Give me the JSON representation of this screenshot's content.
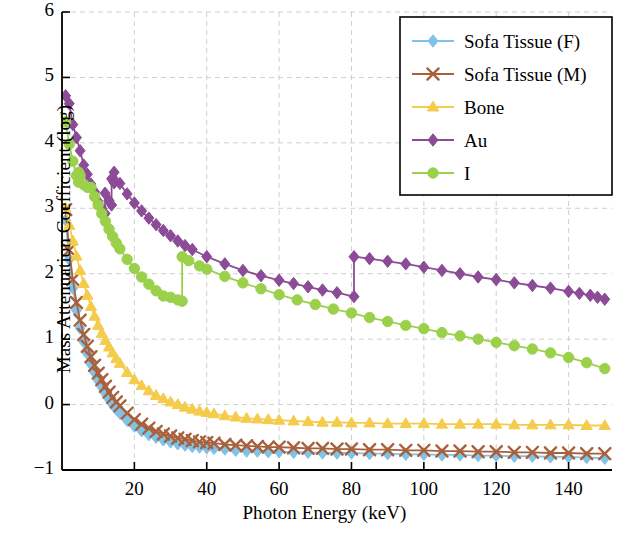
{
  "chart_data": {
    "type": "line",
    "title": "",
    "xlabel": "Photon Energy (keV)",
    "ylabel": "Mass Attenuation Coefficient (log)",
    "xlim": [
      0,
      152
    ],
    "ylim": [
      -1,
      6
    ],
    "xticks": [
      20,
      40,
      60,
      80,
      100,
      120,
      140
    ],
    "yticks": [
      -1,
      0,
      1,
      2,
      3,
      4,
      5,
      6
    ],
    "ytick_labels": [
      "−1",
      "0",
      "1",
      "2",
      "3",
      "4",
      "5",
      "6"
    ],
    "grid": true,
    "legend_position": "top-right",
    "series": [
      {
        "name": "Sofa Tissue (F)",
        "color": "#7FC3E8",
        "marker": "diamond",
        "x": [
          1,
          2,
          3,
          4,
          5,
          6,
          7,
          8,
          9,
          10,
          11,
          12,
          13,
          14,
          15,
          16,
          18,
          20,
          22,
          24,
          26,
          28,
          30,
          32,
          34,
          36,
          38,
          40,
          42,
          45,
          48,
          51,
          54,
          57,
          60,
          64,
          68,
          72,
          76,
          80,
          85,
          90,
          95,
          100,
          105,
          110,
          115,
          120,
          125,
          130,
          135,
          140,
          145,
          150
        ],
        "y": [
          2.82,
          2.22,
          1.78,
          1.44,
          1.17,
          0.96,
          0.78,
          0.62,
          0.49,
          0.37,
          0.27,
          0.17,
          0.08,
          0.0,
          -0.07,
          -0.13,
          -0.24,
          -0.33,
          -0.4,
          -0.46,
          -0.5,
          -0.54,
          -0.57,
          -0.6,
          -0.62,
          -0.64,
          -0.65,
          -0.66,
          -0.67,
          -0.68,
          -0.7,
          -0.71,
          -0.71,
          -0.72,
          -0.72,
          -0.73,
          -0.73,
          -0.74,
          -0.74,
          -0.74,
          -0.75,
          -0.75,
          -0.76,
          -0.76,
          -0.77,
          -0.77,
          -0.78,
          -0.78,
          -0.79,
          -0.79,
          -0.8,
          -0.8,
          -0.81,
          -0.82
        ]
      },
      {
        "name": "Sofa Tissue (M)",
        "color": "#A9603C",
        "marker": "x",
        "x": [
          1,
          2,
          3,
          4,
          5,
          6,
          7,
          8,
          9,
          10,
          11,
          12,
          13,
          14,
          15,
          16,
          18,
          20,
          22,
          24,
          26,
          28,
          30,
          32,
          34,
          36,
          38,
          40,
          42,
          45,
          48,
          51,
          54,
          57,
          60,
          64,
          68,
          72,
          76,
          80,
          85,
          90,
          95,
          100,
          105,
          110,
          115,
          120,
          125,
          130,
          135,
          140,
          145,
          150
        ],
        "y": [
          2.98,
          2.36,
          1.91,
          1.56,
          1.29,
          1.07,
          0.89,
          0.73,
          0.6,
          0.48,
          0.38,
          0.28,
          0.19,
          0.11,
          0.04,
          -0.02,
          -0.13,
          -0.23,
          -0.3,
          -0.36,
          -0.41,
          -0.45,
          -0.48,
          -0.51,
          -0.53,
          -0.55,
          -0.57,
          -0.58,
          -0.59,
          -0.61,
          -0.62,
          -0.63,
          -0.64,
          -0.65,
          -0.65,
          -0.66,
          -0.67,
          -0.67,
          -0.68,
          -0.68,
          -0.69,
          -0.69,
          -0.7,
          -0.7,
          -0.71,
          -0.71,
          -0.72,
          -0.72,
          -0.73,
          -0.73,
          -0.74,
          -0.74,
          -0.75,
          -0.75
        ]
      },
      {
        "name": "Bone",
        "color": "#F5CB4C",
        "marker": "triangle",
        "x": [
          1,
          2,
          3,
          4,
          5,
          6,
          7,
          8,
          9,
          10,
          11,
          12,
          13,
          14,
          15,
          16,
          18,
          20,
          22,
          24,
          26,
          28,
          30,
          32,
          34,
          36,
          38,
          40,
          42,
          45,
          48,
          51,
          54,
          57,
          60,
          64,
          68,
          72,
          76,
          80,
          85,
          90,
          95,
          100,
          105,
          110,
          115,
          120,
          125,
          130,
          135,
          140,
          145,
          150
        ],
        "y": [
          3.0,
          2.74,
          2.5,
          2.27,
          2.05,
          1.85,
          1.67,
          1.5,
          1.35,
          1.21,
          1.09,
          0.98,
          0.88,
          0.79,
          0.7,
          0.63,
          0.49,
          0.38,
          0.29,
          0.21,
          0.14,
          0.09,
          0.04,
          0.0,
          -0.04,
          -0.07,
          -0.1,
          -0.12,
          -0.14,
          -0.17,
          -0.19,
          -0.21,
          -0.22,
          -0.23,
          -0.24,
          -0.25,
          -0.26,
          -0.27,
          -0.27,
          -0.28,
          -0.28,
          -0.29,
          -0.29,
          -0.29,
          -0.3,
          -0.3,
          -0.3,
          -0.3,
          -0.31,
          -0.31,
          -0.31,
          -0.31,
          -0.32,
          -0.32
        ]
      },
      {
        "name": "Au",
        "color": "#8C4B96",
        "marker": "diamond",
        "edge_note": "K-edge at 80.7 keV; L-edges near 11.9-14.4 keV",
        "x": [
          1,
          2,
          3,
          4,
          5,
          6,
          7,
          8,
          9,
          10,
          11,
          11.9,
          11.9,
          13,
          13.7,
          13.7,
          14.4,
          14.4,
          16,
          18,
          20,
          22,
          24,
          26,
          28,
          30,
          32,
          34,
          36,
          40,
          45,
          50,
          55,
          60,
          64,
          68,
          72,
          76,
          80.7,
          80.7,
          85,
          90,
          95,
          100,
          105,
          110,
          115,
          120,
          125,
          130,
          135,
          140,
          143,
          146,
          148,
          150
        ],
        "y": [
          4.72,
          4.6,
          4.28,
          4.08,
          3.88,
          3.66,
          3.52,
          3.37,
          3.25,
          3.1,
          3.0,
          2.92,
          3.23,
          3.12,
          3.05,
          3.45,
          3.39,
          3.55,
          3.38,
          3.22,
          3.08,
          2.96,
          2.85,
          2.75,
          2.66,
          2.58,
          2.5,
          2.43,
          2.37,
          2.26,
          2.15,
          2.05,
          1.97,
          1.9,
          1.85,
          1.8,
          1.75,
          1.71,
          1.65,
          2.26,
          2.23,
          2.19,
          2.15,
          2.1,
          2.05,
          2.0,
          1.95,
          1.91,
          1.86,
          1.82,
          1.78,
          1.73,
          1.7,
          1.67,
          1.64,
          1.61
        ]
      },
      {
        "name": "I",
        "color": "#9BD14A",
        "marker": "circle",
        "edge_note": "K-edge at 33.2 keV",
        "x": [
          1,
          2,
          3,
          4,
          4.6,
          4.6,
          5,
          6,
          7,
          8,
          9,
          10,
          11,
          12,
          13,
          14,
          15,
          16,
          18,
          20,
          22,
          24,
          26,
          28,
          30,
          32,
          33.2,
          33.2,
          35,
          38,
          40,
          45,
          50,
          55,
          60,
          65,
          70,
          75,
          80,
          85,
          90,
          95,
          100,
          105,
          110,
          115,
          120,
          125,
          130,
          135,
          140,
          145,
          150
        ],
        "y": [
          4.32,
          3.98,
          3.72,
          3.5,
          3.4,
          3.55,
          3.5,
          3.36,
          3.32,
          3.32,
          3.18,
          3.05,
          2.92,
          2.8,
          2.68,
          2.57,
          2.47,
          2.38,
          2.22,
          2.08,
          1.95,
          1.84,
          1.74,
          1.66,
          1.64,
          1.6,
          1.58,
          2.26,
          2.2,
          2.12,
          2.07,
          1.96,
          1.86,
          1.77,
          1.68,
          1.6,
          1.53,
          1.46,
          1.4,
          1.33,
          1.27,
          1.21,
          1.16,
          1.1,
          1.05,
          1.0,
          0.95,
          0.9,
          0.85,
          0.79,
          0.72,
          0.64,
          0.55
        ]
      }
    ]
  },
  "legend": {
    "entries": [
      {
        "label": "Sofa Tissue (F)",
        "color": "#7FC3E8",
        "marker": "diamond"
      },
      {
        "label": "Sofa Tissue (M)",
        "color": "#A9603C",
        "marker": "x"
      },
      {
        "label": "Bone",
        "color": "#F5CB4C",
        "marker": "triangle"
      },
      {
        "label": "Au",
        "color": "#8C4B96",
        "marker": "diamond"
      },
      {
        "label": "I",
        "color": "#9BD14A",
        "marker": "circle"
      }
    ]
  },
  "style": {
    "axis_color": "#000000",
    "grid_color": "#cfcfcf",
    "background": "#ffffff"
  }
}
